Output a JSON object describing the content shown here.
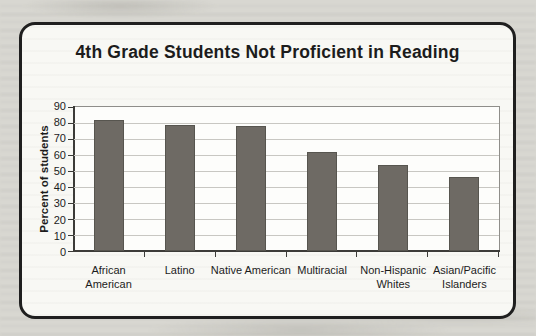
{
  "chart_data": {
    "type": "bar",
    "title": "4th Grade Students Not Proficient in Reading",
    "ylabel": "Percent of students",
    "xlabel": "",
    "categories": [
      "African American",
      "Latino",
      "Native American",
      "Multiracial",
      "Non-Hispanic Whites",
      "Asian/Pacific Islanders"
    ],
    "values": [
      82,
      79,
      78,
      62,
      54,
      46
    ],
    "ylim": [
      0,
      90
    ],
    "ytick_step": 10,
    "grid": true,
    "legend": false,
    "colors": {
      "bar": "#6e6a64",
      "axis": "#3c3b38",
      "gridline": "#c8c7c2",
      "plot_border": "#8f8e8a",
      "frame_border": "#1f1f1f",
      "frame_background": "#f8f8f4",
      "page_background": "#d8d7d1",
      "text": "#1c1c1c"
    }
  }
}
